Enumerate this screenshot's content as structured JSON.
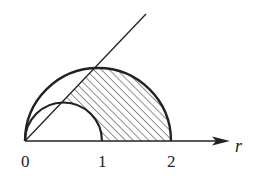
{
  "diagram": {
    "type": "polar-region",
    "axis": {
      "label": "r",
      "ticks": [
        "0",
        "1",
        "2"
      ]
    },
    "curves": [
      {
        "name": "inner-semicircle",
        "center_r": 0.5,
        "radius": 0.5
      },
      {
        "name": "outer-semicircle",
        "center_r": 1.0,
        "radius": 1.0
      }
    ],
    "ray": {
      "from": "origin",
      "direction": "upper-right"
    },
    "shaded_region": "between inner and outer semicircles, below the ray",
    "colors": {
      "stroke": "#222222",
      "background": "#ffffff"
    }
  }
}
